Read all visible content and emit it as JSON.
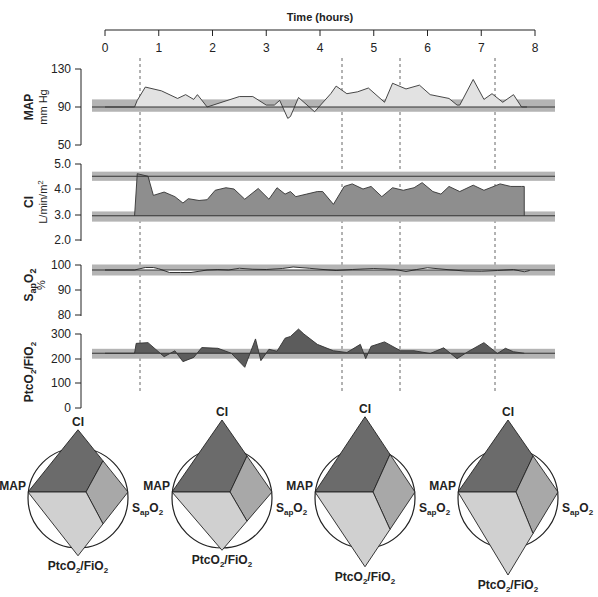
{
  "chart_data": [
    {
      "type": "area",
      "id": "time_axis",
      "title": "Time (hours)",
      "x_ticks": [
        0,
        1,
        2,
        3,
        4,
        5,
        6,
        7,
        8
      ],
      "event_markers_hours": [
        0.65,
        4.4,
        4.45,
        7.3
      ],
      "event_markers_note": "Dashed vertical lines at approx 0.65, 3.4, 4.45, 7.3 h"
    },
    {
      "type": "area",
      "id": "map",
      "ylabel": "MAP",
      "yunit": "mm Hg",
      "yticks": [
        130,
        90,
        50
      ],
      "ylim": [
        50,
        130
      ],
      "target_band": [
        85,
        95
      ],
      "baseline": 90,
      "x": [
        0.0,
        0.55,
        0.6,
        0.75,
        1.05,
        1.35,
        1.5,
        1.65,
        1.72,
        1.9,
        2.5,
        2.75,
        3.0,
        3.15,
        3.25,
        3.4,
        3.45,
        3.6,
        3.9,
        4.2,
        4.3,
        4.5,
        4.7,
        4.9,
        5.2,
        5.35,
        5.6,
        5.85,
        6.05,
        6.4,
        6.55,
        6.6,
        6.85,
        7.05,
        7.2,
        7.4,
        7.6,
        7.75,
        7.85
      ],
      "values": [
        90,
        90,
        97,
        111,
        107,
        99,
        103,
        98,
        103,
        90,
        101,
        101,
        92,
        92,
        97,
        78,
        80,
        100,
        85,
        104,
        112,
        104,
        106,
        110,
        95,
        115,
        109,
        113,
        103,
        99,
        92,
        92,
        119,
        98,
        104,
        95,
        103,
        90,
        90
      ],
      "fill": "#e0e0e0"
    },
    {
      "type": "area",
      "id": "ci",
      "ylabel": "CI",
      "yunit": "L/min/m2",
      "yticks": [
        5.0,
        4.0,
        3.0,
        2.0
      ],
      "ylim": [
        2.0,
        5.0
      ],
      "target_band_upper": [
        4.35,
        4.65
      ],
      "target_band_lower": [
        2.75,
        3.1
      ],
      "upper_line": 4.5,
      "lower_line": 2.95,
      "x": [
        0.55,
        0.6,
        0.8,
        0.9,
        1.1,
        1.3,
        1.45,
        1.55,
        1.75,
        1.9,
        2.05,
        2.25,
        2.4,
        2.6,
        2.85,
        3.05,
        3.2,
        3.35,
        3.45,
        3.55,
        3.75,
        3.95,
        4.05,
        4.25,
        4.45,
        4.6,
        4.8,
        4.95,
        5.15,
        5.35,
        5.55,
        5.75,
        5.9,
        6.1,
        6.25,
        6.4,
        6.6,
        6.85,
        7.05,
        7.35,
        7.55,
        7.75,
        7.8
      ],
      "values": [
        2.95,
        4.6,
        4.5,
        3.75,
        3.88,
        3.7,
        3.45,
        3.62,
        3.55,
        3.58,
        3.95,
        4.05,
        4.0,
        3.6,
        4.02,
        3.6,
        4.05,
        3.8,
        3.9,
        3.7,
        3.8,
        3.9,
        3.9,
        3.4,
        4.1,
        4.2,
        4.0,
        4.1,
        3.7,
        4.05,
        3.95,
        4.05,
        4.25,
        3.9,
        3.8,
        4.1,
        3.9,
        4.15,
        3.95,
        4.2,
        4.1,
        4.1,
        4.1
      ],
      "fill": "#909090"
    },
    {
      "type": "line",
      "id": "sap",
      "ylabel": "SapO2",
      "yunit": "%",
      "yticks": [
        100,
        90,
        80
      ],
      "ylim": [
        80,
        100
      ],
      "target_band": [
        96,
        100
      ],
      "baseline": 98,
      "x": [
        0,
        0.55,
        0.75,
        0.9,
        1.0,
        1.2,
        1.4,
        1.6,
        1.9,
        2.1,
        2.3,
        2.5,
        2.75,
        3.0,
        3.3,
        3.5,
        3.8,
        4.0,
        4.3,
        4.6,
        5.0,
        5.4,
        5.6,
        5.8,
        6.0,
        6.4,
        6.7,
        7.0,
        7.3,
        7.6,
        7.8,
        7.9
      ],
      "values": [
        98,
        98,
        99,
        99,
        98.5,
        97,
        97,
        97,
        98,
        98.2,
        98,
        98.7,
        98.3,
        98.2,
        98.6,
        99.2,
        98.7,
        98.3,
        97.8,
        98.2,
        98.6,
        98.2,
        97.4,
        98.2,
        98.9,
        98.1,
        97.6,
        97.5,
        97.8,
        98.2,
        97.3,
        97.8
      ]
    },
    {
      "type": "area",
      "id": "ptco2_fio2",
      "ylabel": "PtcO2/FIO2",
      "yticks": [
        300,
        200,
        100,
        0
      ],
      "ylim": [
        0,
        300
      ],
      "target_band": [
        200,
        240
      ],
      "baseline": 222,
      "x": [
        0.0,
        0.55,
        0.58,
        0.8,
        1.1,
        1.3,
        1.45,
        1.65,
        1.8,
        2.1,
        2.35,
        2.6,
        2.8,
        2.9,
        3.05,
        3.2,
        3.35,
        3.45,
        3.6,
        3.7,
        3.95,
        4.25,
        4.5,
        4.75,
        4.85,
        4.95,
        5.2,
        5.5,
        5.75,
        6.05,
        6.3,
        6.55,
        6.75,
        7.05,
        7.3,
        7.45,
        7.6,
        7.8
      ],
      "values": [
        222,
        222,
        262,
        265,
        208,
        232,
        188,
        205,
        245,
        242,
        222,
        165,
        280,
        192,
        238,
        230,
        283,
        290,
        320,
        300,
        258,
        232,
        225,
        258,
        200,
        250,
        268,
        232,
        232,
        221,
        244,
        200,
        228,
        265,
        221,
        242,
        228,
        222
      ],
      "fill": "#5a5a5a"
    },
    {
      "type": "radar",
      "id": "diamonds",
      "axes": [
        "CI",
        "SapO2",
        "PtcO2/FIO2",
        "MAP"
      ],
      "reference_circle": true,
      "panels": [
        {
          "label": "t1",
          "CI": 1.05,
          "SapO2": 1.0,
          "PtcO2/FIO2": 1.05,
          "MAP": 1.0
        },
        {
          "label": "t2",
          "CI": 1.2,
          "SapO2": 1.0,
          "PtcO2/FIO2": 0.95,
          "MAP": 1.0
        },
        {
          "label": "t3",
          "CI": 1.25,
          "SapO2": 1.0,
          "PtcO2/FIO2": 1.25,
          "MAP": 1.0
        },
        {
          "label": "t4",
          "CI": 1.2,
          "SapO2": 1.0,
          "PtcO2/FIO2": 1.4,
          "MAP": 1.0
        }
      ]
    }
  ],
  "header": {
    "time_title": "Time (hours)"
  },
  "panels": {
    "map": {
      "label": "MAP",
      "unit": "mm Hg",
      "ticks": [
        "130",
        "90",
        "50"
      ]
    },
    "ci": {
      "label": "CI",
      "unit_main": "L/min/m",
      "unit_sup": "2",
      "ticks": [
        "5.0",
        "4.0",
        "3.0",
        "2.0"
      ]
    },
    "sap": {
      "label_main": "S",
      "label_sub": "ap",
      "label_o": "O",
      "label_sub2": "2",
      "unit": "%",
      "ticks": [
        "100",
        "90",
        "80"
      ]
    },
    "ptc": {
      "label_main": "Ptc",
      "label_o": "O",
      "label_sub": "2",
      "label_sep": "/Fi",
      "label_o2": "O",
      "label_sub2": "2",
      "ticks": [
        "300",
        "200",
        "100",
        "0"
      ]
    }
  },
  "time_ticks": [
    "0",
    "1",
    "2",
    "3",
    "4",
    "5",
    "6",
    "7",
    "8"
  ],
  "radar_labels": {
    "ci": "CI",
    "map": "MAP",
    "sap_main": "S",
    "sap_sub": "ap",
    "sap_o": "O",
    "sap_sub2": "2",
    "ptc_main": "Ptc",
    "ptc_o": "O",
    "ptc_sub": "2",
    "ptc_sep": "/Fi",
    "ptc_o2": "O",
    "ptc_sub2": "2"
  },
  "colors": {
    "band": "#b4b4b4",
    "map_fill": "#e2e2e2",
    "ci_fill": "#8e8e8e",
    "ptc_fill": "#5c5c5c",
    "radar_top": "#6b6b6b",
    "radar_right": "#a8a8a8",
    "radar_bottom": "#d0d0d0",
    "line": "#333333"
  }
}
